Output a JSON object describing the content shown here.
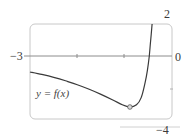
{
  "chart_data": {
    "type": "line",
    "title": "",
    "xlabel": "",
    "ylabel": "",
    "xlim": [
      -3,
      0
    ],
    "ylim": [
      -4,
      2
    ],
    "grid": false,
    "legend": null,
    "axis_labels": {
      "x_left": "−3",
      "x_right": "0",
      "y_top": "2",
      "y_bottom": "−4"
    },
    "x_ticks": [
      -2,
      -1
    ],
    "annotations": [
      {
        "text": "y = f(x)",
        "x": -2.85,
        "y": -2.3
      },
      {
        "type": "marker",
        "shape": "circle",
        "x": -0.89,
        "y": -3.19,
        "note": "local minimum"
      }
    ],
    "series": [
      {
        "name": "y = f(x)",
        "points": [
          [
            -3.0,
            -1.0
          ],
          [
            -2.75,
            -1.15
          ],
          [
            -2.5,
            -1.33
          ],
          [
            -2.25,
            -1.55
          ],
          [
            -2.0,
            -1.8
          ],
          [
            -1.75,
            -2.08
          ],
          [
            -1.5,
            -2.4
          ],
          [
            -1.25,
            -2.75
          ],
          [
            -1.05,
            -3.05
          ],
          [
            -0.89,
            -3.19
          ],
          [
            -0.75,
            -3.05
          ],
          [
            -0.65,
            -2.6
          ],
          [
            -0.57,
            -1.7
          ],
          [
            -0.52,
            -0.9
          ],
          [
            -0.48,
            0.0
          ],
          [
            -0.45,
            1.0
          ],
          [
            -0.42,
            2.0
          ]
        ]
      }
    ]
  },
  "colors": {
    "curve": "#3a3a3a",
    "axis": "#8c8c8c",
    "frame": "#c8c8c8",
    "marker_fill": "#d9d9d9"
  }
}
